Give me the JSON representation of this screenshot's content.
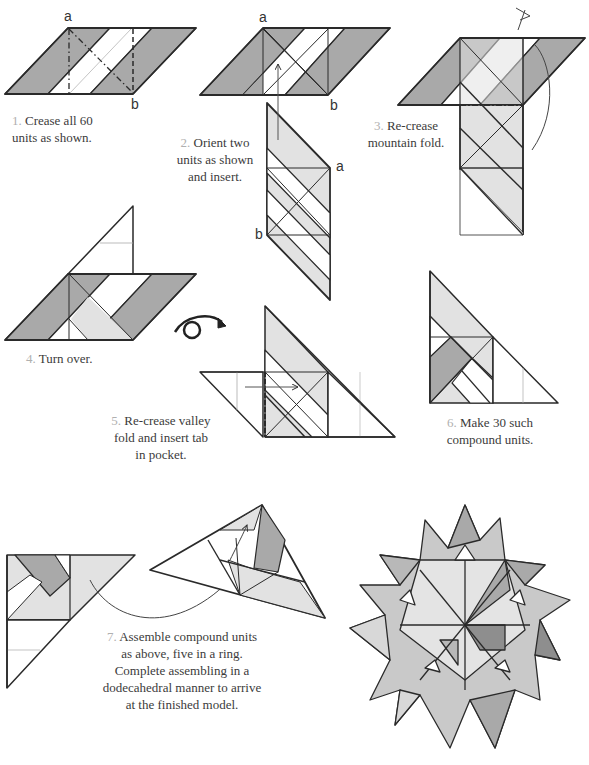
{
  "diagram": {
    "colors": {
      "dark": "#a9a9a9",
      "light": "#e2e2e2",
      "white": "#ffffff",
      "line": "#2a2a2a",
      "thin": "#9a9a9a",
      "numeral": "#b0b0b0"
    },
    "steps": [
      {
        "number": "1",
        "lines": [
          "Crease all 60",
          "units as shown."
        ],
        "labels": [
          "a",
          "b"
        ]
      },
      {
        "number": "2",
        "lines": [
          "Orient two",
          "units as shown",
          "and insert."
        ],
        "labels": [
          "a",
          "b",
          "a",
          "b"
        ]
      },
      {
        "number": "3",
        "lines": [
          "Re-crease",
          "mountain fold."
        ]
      },
      {
        "number": "4",
        "lines": [
          "Turn over."
        ],
        "icon": "turn-over-icon"
      },
      {
        "number": "5",
        "lines": [
          "Re-crease valley",
          "fold and insert tab",
          "in pocket."
        ]
      },
      {
        "number": "6",
        "lines": [
          "Make 30 such",
          "compound units."
        ]
      },
      {
        "number": "7",
        "lines": [
          "Assemble compound units",
          "as above, five in a ring.",
          "Complete assembling in a",
          "dodecahedral manner to arrive",
          "at the finished model."
        ]
      }
    ],
    "final_model": "finished-star-polyhedron"
  }
}
